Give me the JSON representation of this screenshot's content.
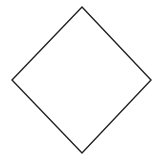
{
  "canvas": {
    "width": 161,
    "height": 162,
    "background": "#ffffff"
  },
  "shape": {
    "type": "diamond",
    "points": [
      [
        82,
        7
      ],
      [
        151,
        80
      ],
      [
        82,
        153
      ],
      [
        12,
        80
      ]
    ],
    "stroke": "#222222",
    "stroke_width": 1.4,
    "fill": "none"
  }
}
